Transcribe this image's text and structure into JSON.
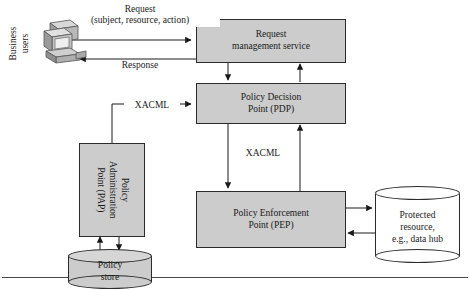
{
  "diagram": {
    "fill_color": "#cccccc",
    "stroke_color": "#2b2b2b",
    "background": "#ffffff",
    "actor": {
      "label_line1": "Business",
      "label_line2": "users",
      "icon": "workstation-icon"
    },
    "nodes": [
      {
        "id": "request-management-service",
        "line1": "Request",
        "line2": "management service",
        "shape": "rect"
      },
      {
        "id": "policy-decision-point",
        "line1": "Policy Decision",
        "line2": "Point (PDP)",
        "shape": "rect"
      },
      {
        "id": "policy-enforcement-point",
        "line1": "Policy Enforcement",
        "line2": "Point (PEP)",
        "shape": "rect"
      },
      {
        "id": "policy-administration-point",
        "line1": "Policy",
        "line2": "Administration",
        "line3": "Point (PAP)",
        "shape": "rect-rotated"
      },
      {
        "id": "policy-store",
        "line1": "Policy",
        "line2": "store",
        "shape": "cylinder",
        "fill": "#cccccc"
      },
      {
        "id": "protected-resource",
        "line1": "Protected",
        "line2": "resource,",
        "line3": "e.g., data hub",
        "shape": "cylinder",
        "fill": "#ffffff"
      }
    ],
    "edges": [
      {
        "id": "request-edge",
        "from": "business-users",
        "to": "request-management-service",
        "label_line1": "Request",
        "label_line2": "(subject, resource, action)",
        "direction": "right"
      },
      {
        "id": "response-edge",
        "from": "request-management-service",
        "to": "business-users",
        "label": "Response",
        "direction": "left"
      },
      {
        "id": "rms-to-pdp-edge",
        "from": "request-management-service",
        "to": "policy-decision-point",
        "label": "",
        "direction": "down"
      },
      {
        "id": "pdp-to-rms-edge",
        "from": "policy-decision-point",
        "to": "request-management-service",
        "label": "",
        "direction": "up"
      },
      {
        "id": "pap-to-pdp-edge",
        "from": "policy-administration-point",
        "to": "policy-decision-point",
        "label": "XACML",
        "direction": "right"
      },
      {
        "id": "pdp-to-pep-edge",
        "from": "policy-decision-point",
        "to": "policy-enforcement-point",
        "label": "XACML",
        "direction": "down"
      },
      {
        "id": "pep-to-pdp-edge",
        "from": "policy-enforcement-point",
        "to": "policy-decision-point",
        "label": "",
        "direction": "up"
      },
      {
        "id": "pap-to-store-edge",
        "from": "policy-administration-point",
        "to": "policy-store",
        "label": "",
        "direction": "down"
      },
      {
        "id": "store-to-pap-edge",
        "from": "policy-store",
        "to": "policy-administration-point",
        "label": "",
        "direction": "up"
      },
      {
        "id": "pep-to-resource-edge",
        "from": "policy-enforcement-point",
        "to": "protected-resource",
        "label": "",
        "direction": "right"
      },
      {
        "id": "resource-to-pep-edge",
        "from": "protected-resource",
        "to": "policy-enforcement-point",
        "label": "",
        "direction": "left"
      }
    ]
  }
}
